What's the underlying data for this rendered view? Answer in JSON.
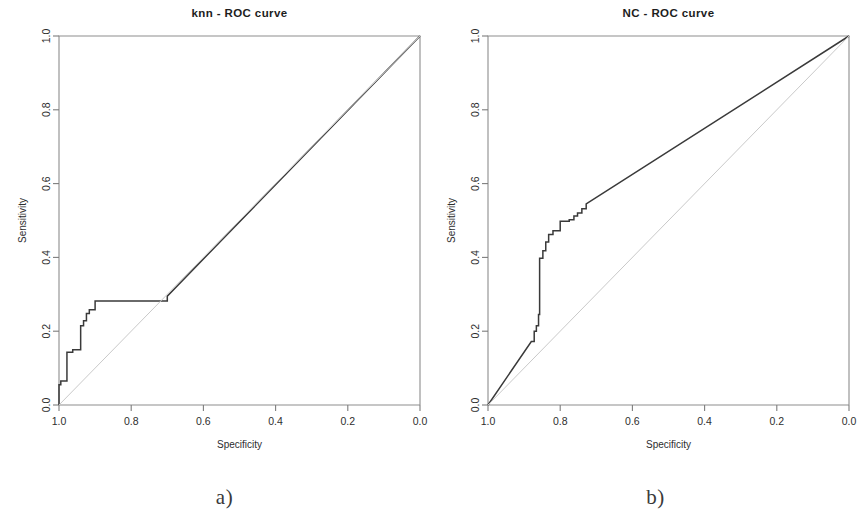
{
  "figure": {
    "background": "#ffffff",
    "line_color": "#3a3a3a",
    "frame_color": "#8d8d8d",
    "diagonal_color": "#c9c9c9",
    "captions": [
      {
        "id": "a",
        "text": "a)"
      },
      {
        "id": "b",
        "text": "b)"
      }
    ]
  },
  "chart_data": [
    {
      "type": "line",
      "panel": "a",
      "title": "knn  - ROC curve",
      "xlabel": "Specificity",
      "ylabel": "Sensitivity",
      "xlim": [
        1.0,
        0.0
      ],
      "ylim": [
        0.0,
        1.0
      ],
      "x_reversed": true,
      "grid": false,
      "legend": "none",
      "xticks": [
        1.0,
        0.8,
        0.6,
        0.4,
        0.2,
        0.0
      ],
      "xtick_labels": [
        "1.0",
        "0.8",
        "0.6",
        "0.4",
        "0.2",
        "0.0"
      ],
      "yticks": [
        0.0,
        0.2,
        0.4,
        0.6,
        0.8,
        1.0
      ],
      "ytick_labels": [
        "0.0",
        "0.2",
        "0.4",
        "0.6",
        "0.8",
        "1.0"
      ],
      "annotations": [
        "reference diagonal from (1.0,0.0) to (0.0,1.0)"
      ],
      "series": [
        {
          "name": "knn ROC",
          "style": "step",
          "x": [
            1.0,
            1.0,
            0.995,
            0.995,
            0.978,
            0.978,
            0.962,
            0.962,
            0.94,
            0.94,
            0.932,
            0.932,
            0.924,
            0.924,
            0.916,
            0.916,
            0.9,
            0.9,
            0.7,
            0.7,
            0.0
          ],
          "y": [
            0.0,
            0.055,
            0.055,
            0.065,
            0.065,
            0.143,
            0.143,
            0.15,
            0.15,
            0.215,
            0.215,
            0.228,
            0.228,
            0.248,
            0.248,
            0.258,
            0.258,
            0.282,
            0.282,
            0.295,
            1.0
          ]
        },
        {
          "name": "chance diagonal",
          "style": "line",
          "x": [
            1.0,
            0.0
          ],
          "y": [
            0.0,
            1.0
          ]
        }
      ]
    },
    {
      "type": "line",
      "panel": "b",
      "title": "NC  - ROC curve",
      "xlabel": "Specificity",
      "ylabel": "Sensitivity",
      "xlim": [
        1.0,
        0.0
      ],
      "ylim": [
        0.0,
        1.0
      ],
      "x_reversed": true,
      "grid": false,
      "legend": "none",
      "xticks": [
        1.0,
        0.8,
        0.6,
        0.4,
        0.2,
        0.0
      ],
      "xtick_labels": [
        "1.0",
        "0.8",
        "0.6",
        "0.4",
        "0.2",
        "0.0"
      ],
      "yticks": [
        0.0,
        0.2,
        0.4,
        0.6,
        0.8,
        1.0
      ],
      "ytick_labels": [
        "0.0",
        "0.2",
        "0.4",
        "0.6",
        "0.8",
        "1.0"
      ],
      "annotations": [
        "reference diagonal from (1.0,0.0) to (0.0,1.0)"
      ],
      "series": [
        {
          "name": "NC ROC",
          "style": "step",
          "x": [
            1.0,
            0.88,
            0.872,
            0.872,
            0.866,
            0.866,
            0.86,
            0.86,
            0.857,
            0.857,
            0.848,
            0.848,
            0.84,
            0.84,
            0.832,
            0.832,
            0.82,
            0.82,
            0.8,
            0.8,
            0.775,
            0.775,
            0.762,
            0.762,
            0.752,
            0.752,
            0.74,
            0.74,
            0.728,
            0.728,
            0.0
          ],
          "y": [
            0.0,
            0.172,
            0.172,
            0.2,
            0.2,
            0.215,
            0.215,
            0.245,
            0.245,
            0.398,
            0.398,
            0.418,
            0.418,
            0.442,
            0.442,
            0.462,
            0.462,
            0.472,
            0.472,
            0.498,
            0.498,
            0.502,
            0.502,
            0.512,
            0.512,
            0.52,
            0.52,
            0.532,
            0.532,
            0.545,
            1.0
          ]
        },
        {
          "name": "chance diagonal",
          "style": "line",
          "x": [
            1.0,
            0.0
          ],
          "y": [
            0.0,
            1.0
          ]
        }
      ]
    }
  ]
}
